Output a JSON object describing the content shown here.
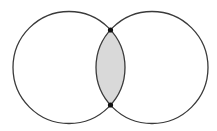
{
  "diagram": {
    "type": "venn-two-circles",
    "canvas": {
      "width": 217,
      "height": 131,
      "background": "#ffffff"
    },
    "circles": [
      {
        "id": "left",
        "cx": 69,
        "cy": 67.5,
        "r": 56
      },
      {
        "id": "right",
        "cx": 152,
        "cy": 67.5,
        "r": 56
      }
    ],
    "intersection": {
      "fill": "#d9d9d9",
      "shaded": true
    },
    "intersection_points": [
      {
        "id": "top",
        "x": 110.5,
        "y": 30
      },
      {
        "id": "bottom",
        "x": 110.5,
        "y": 105
      }
    ],
    "colors": {
      "stroke": "#3a3a3a",
      "point": "#111111",
      "shade": "#d9d9d9"
    }
  }
}
